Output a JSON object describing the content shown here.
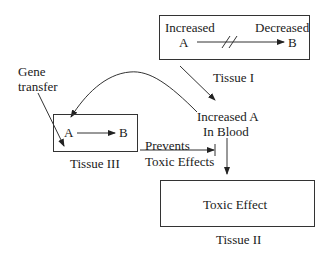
{
  "tissue1": {
    "increased_label": "Increased",
    "decreased_label": "Decreased",
    "from": "A",
    "to": "B",
    "blocked_marker": "//",
    "caption": "Tissue I"
  },
  "gene_transfer": {
    "line1": "Gene",
    "line2": "transfer"
  },
  "blood": {
    "line1": "Increased A",
    "line2": "In Blood"
  },
  "tissue3": {
    "from": "A",
    "to": "B",
    "caption": "Tissue III"
  },
  "prevents": {
    "line1": "Prevents",
    "line2": "Toxic Effects"
  },
  "tissue2": {
    "content": "Toxic Effect",
    "caption": "Tissue II"
  },
  "colors": {
    "line": "#333333",
    "text": "#1a1a1a"
  }
}
